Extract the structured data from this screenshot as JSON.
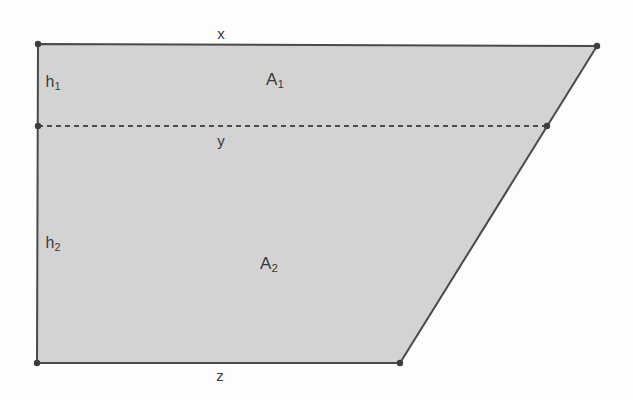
{
  "figure": {
    "shape_type": "trapezoid",
    "fill_color": "#d3d3d3",
    "stroke_color": "#4a4a4a",
    "background_color": "#fdfdfd",
    "vertex_dot_color": "#3d3d3d",
    "outline_width_px": 2,
    "divider_style": "dashed",
    "vertices": {
      "top_left": {
        "x": 38,
        "y": 44
      },
      "top_right": {
        "x": 597,
        "y": 46
      },
      "bottom_right": {
        "x": 400,
        "y": 363
      },
      "bottom_left": {
        "x": 37,
        "y": 363
      }
    },
    "divider": {
      "left": {
        "x": 38,
        "y": 126
      },
      "right": {
        "x": 547,
        "y": 126
      }
    },
    "dots": [
      {
        "x": 38,
        "y": 44
      },
      {
        "x": 597,
        "y": 46
      },
      {
        "x": 400,
        "y": 363
      },
      {
        "x": 37,
        "y": 363
      },
      {
        "x": 38,
        "y": 126
      },
      {
        "x": 547,
        "y": 126
      }
    ]
  },
  "labels": {
    "top_side": {
      "text": "x",
      "sub": "",
      "x": 221,
      "y": 33
    },
    "divider": {
      "text": "y",
      "sub": "",
      "x": 221,
      "y": 140
    },
    "bottom_side": {
      "text": "z",
      "sub": "",
      "x": 220,
      "y": 375
    },
    "upper_area": {
      "text": "A",
      "sub": "1",
      "x": 275,
      "y": 81
    },
    "lower_area": {
      "text": "A",
      "sub": "2",
      "x": 269,
      "y": 265
    },
    "upper_height": {
      "text": "h",
      "sub": "1",
      "x": 53,
      "y": 83
    },
    "lower_height": {
      "text": "h",
      "sub": "2",
      "x": 53,
      "y": 244
    }
  }
}
